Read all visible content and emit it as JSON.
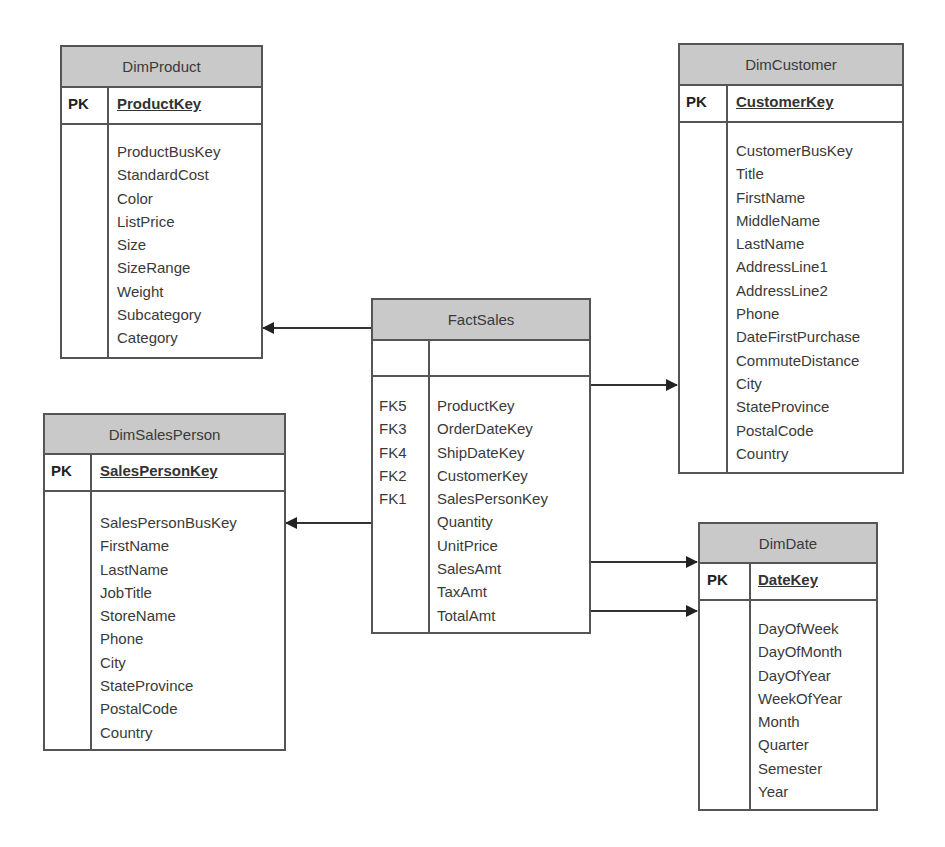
{
  "diagram": {
    "type": "star-schema",
    "fact_table": {
      "name": "FactSales",
      "fields": [
        {
          "key": "FK5",
          "name": "ProductKey"
        },
        {
          "key": "FK3",
          "name": "OrderDateKey"
        },
        {
          "key": "FK4",
          "name": "ShipDateKey"
        },
        {
          "key": "FK2",
          "name": "CustomerKey"
        },
        {
          "key": "FK1",
          "name": "SalesPersonKey"
        },
        {
          "key": "",
          "name": "Quantity"
        },
        {
          "key": "",
          "name": "UnitPrice"
        },
        {
          "key": "",
          "name": "SalesAmt"
        },
        {
          "key": "",
          "name": "TaxAmt"
        },
        {
          "key": "",
          "name": "TotalAmt"
        }
      ]
    },
    "dimensions": {
      "product": {
        "name": "DimProduct",
        "pk_label": "PK",
        "pk": "ProductKey",
        "fields": [
          "ProductBusKey",
          "StandardCost",
          "Color",
          "ListPrice",
          "Size",
          "SizeRange",
          "Weight",
          "Subcategory",
          "Category"
        ]
      },
      "customer": {
        "name": "DimCustomer",
        "pk_label": "PK",
        "pk": "CustomerKey",
        "fields": [
          "CustomerBusKey",
          "Title",
          "FirstName",
          "MiddleName",
          "LastName",
          "AddressLine1",
          "AddressLine2",
          "Phone",
          "DateFirstPurchase",
          "CommuteDistance",
          "City",
          "StateProvince",
          "PostalCode",
          "Country"
        ]
      },
      "salesperson": {
        "name": "DimSalesPerson",
        "pk_label": "PK",
        "pk": "SalesPersonKey",
        "fields": [
          "SalesPersonBusKey",
          "FirstName",
          "LastName",
          "JobTitle",
          "StoreName",
          "Phone",
          "City",
          "StateProvince",
          "PostalCode",
          "Country"
        ]
      },
      "date": {
        "name": "DimDate",
        "pk_label": "PK",
        "pk": "DateKey",
        "fields": [
          "DayOfWeek",
          "DayOfMonth",
          "DayOfYear",
          "WeekOfYear",
          "Month",
          "Quarter",
          "Semester",
          "Year"
        ]
      }
    },
    "relationships": [
      {
        "from": "FactSales",
        "to": "DimProduct"
      },
      {
        "from": "FactSales",
        "to": "DimCustomer"
      },
      {
        "from": "FactSales",
        "to": "DimSalesPerson"
      },
      {
        "from": "FactSales",
        "to": "DimDate"
      },
      {
        "from": "FactSales",
        "to": "DimDate"
      }
    ],
    "colors": {
      "header_fill": "#c9c9c9",
      "border": "#555555",
      "text": "#3a3a3a"
    }
  }
}
